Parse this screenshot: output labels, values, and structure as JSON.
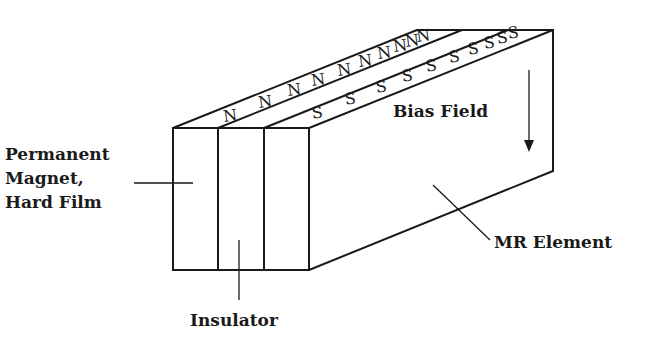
{
  "diagram": {
    "labels": {
      "permanent_magnet_line1": "Permanent",
      "permanent_magnet_line2": "Magnet,",
      "permanent_magnet_line3": "Hard Film",
      "insulator": "Insulator",
      "bias_field": "Bias Field",
      "mr_element": "MR Element"
    },
    "north_pole": "N",
    "south_pole": "S",
    "north_pole_count": 10,
    "south_pole_count": 10,
    "colors": {
      "ink": "#1a1a1a",
      "background": "#ffffff"
    }
  }
}
